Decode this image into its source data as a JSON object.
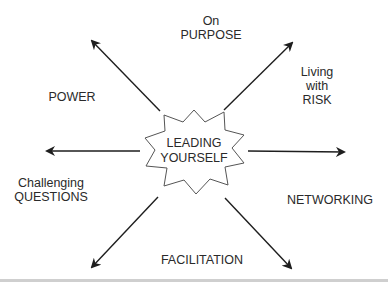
{
  "diagram": {
    "center": {
      "line1": "LEADING",
      "line2": "YOURSELF"
    },
    "labels": {
      "top": {
        "line1": "On",
        "line2": "PURPOSE"
      },
      "top_left": {
        "text": "POWER"
      },
      "top_right": {
        "line1": "Living",
        "line2": "with",
        "line3": "RISK"
      },
      "bottom_left": {
        "line1": "Challenging",
        "line2": "QUESTIONS"
      },
      "right": {
        "text": "NETWORKING"
      },
      "bottom": {
        "text": "FACILITATION"
      }
    },
    "colors": {
      "line": "#2a2a2a",
      "text": "#2a2a2a",
      "star_stroke": "#555555"
    }
  }
}
